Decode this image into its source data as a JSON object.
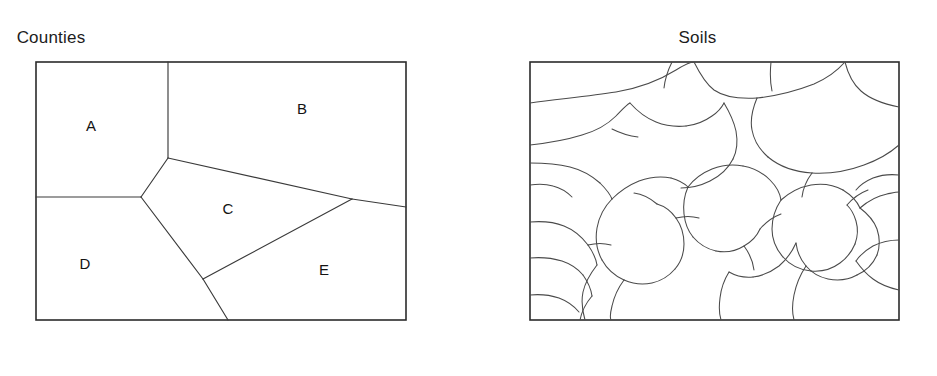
{
  "figure": {
    "background_color": "#ffffff",
    "line_color": "#3a3a3a",
    "frame_color": "#2b2b2b",
    "text_color": "#1c1c1c",
    "width": 937,
    "height": 376
  },
  "panels": [
    {
      "id": "counties",
      "title": "Counties",
      "frame": {
        "x": 36,
        "y": 62,
        "width": 370,
        "height": 258
      },
      "regions": [
        {
          "label": "A",
          "label_x": 91,
          "label_y": 127
        },
        {
          "label": "B",
          "label_x": 302,
          "label_y": 110
        },
        {
          "label": "C",
          "label_x": 228,
          "label_y": 210
        },
        {
          "label": "D",
          "label_x": 85,
          "label_y": 265
        },
        {
          "label": "E",
          "label_x": 324,
          "label_y": 271
        }
      ],
      "boundaries": [
        "M168,62 L168,158",
        "M36,197 L141,197",
        "M141,197 L168,158",
        "M168,158 L352,199",
        "M352,199 L406,207",
        "M352,199 L203,279",
        "M141,197 L203,279",
        "M203,279 L228,320"
      ]
    },
    {
      "id": "soils",
      "title": "Soils",
      "frame": {
        "x": 530,
        "y": 62,
        "width": 369,
        "height": 258
      },
      "polygon_count": 38,
      "polylines": [
        "M530,103 C560,99 590,96 616,92 C640,88 660,80 676,70 C684,65 690,62 694,62",
        "M694,62 C700,74 706,84 714,90 C724,97 740,99 757,98",
        "M757,98 C776,96 796,91 814,84 C828,78 838,70 845,62",
        "M845,62 C848,74 853,84 861,91 C870,99 884,104 899,107",
        "M757,98 C752,110 750,120 752,130 C754,141 760,150 768,157",
        "M768,157 C780,167 796,172 812,173",
        "M812,173 C830,174 848,171 864,165 C878,160 890,153 899,145",
        "M530,145 C548,143 566,140 582,135 C596,131 608,124 616,116 C622,110 626,105 630,103",
        "M630,103 C638,112 646,118 656,122 C666,126 676,127 686,126",
        "M686,126 C696,125 705,121 712,116 C718,112 722,107 724,103",
        "M724,103 C730,113 734,122 736,131 C738,142 737,151 733,159",
        "M733,159 C728,169 720,176 710,181 C700,186 690,188 681,188",
        "M530,163 C544,163 558,164 570,167 C582,170 592,176 600,183",
        "M600,183 C606,189 610,194 612,199",
        "M612,199 C620,191 629,185 639,181 C650,177 661,176 671,178",
        "M671,178 C678,180 684,183 688,187",
        "M688,187 C694,179 702,173 712,169 C722,165 733,164 743,166",
        "M743,166 C754,168 763,173 770,180 C776,186 780,193 781,200",
        "M781,200 C790,192 800,187 811,185 C823,183 834,185 843,190",
        "M843,190 C851,195 857,201 860,208",
        "M860,208 C868,201 877,196 887,194 C892,193 896,192 899,192",
        "M781,200 C775,209 772,219 772,229 C772,240 776,249 783,257",
        "M783,257 C790,265 800,270 811,271",
        "M811,271 C822,272 832,269 840,263 C847,258 852,251 855,244",
        "M855,244 C858,236 858,228 856,221 C854,214 851,209 847,205",
        "M612,199 C604,207 599,217 597,228 C595,240 597,251 602,260",
        "M602,260 C607,269 615,276 624,280",
        "M624,280 C633,284 643,285 652,283 C661,281 669,276 675,269",
        "M675,269 C681,262 684,253 684,244 C684,234 681,225 676,218",
        "M676,218 C671,211 664,206 657,204",
        "M688,187 C684,196 683,205 684,214 C685,223 688,231 693,237",
        "M693,237 C699,244 707,249 716,251",
        "M716,251 C726,253 736,251 744,246 C751,242 757,236 760,229",
        "M530,222 C542,221 554,222 564,226 C574,230 582,237 588,245",
        "M588,245 C593,252 596,259 597,265",
        "M597,265 C590,274 585,283 583,292 C581,302 582,310 585,320",
        "M530,258 C541,257 552,258 562,261 C571,264 578,269 583,275",
        "M583,275 C588,282 591,289 592,296",
        "M592,296 C586,303 582,310 580,320",
        "M860,208 C868,214 874,221 877,229 C880,238 880,247 877,255",
        "M877,255 C873,264 866,271 857,275",
        "M857,275 C848,280 838,281 828,279 C819,277 811,272 806,266",
        "M806,266 C800,259 797,251 796,243",
        "M796,243 C792,252 786,260 779,266 C771,272 762,276 753,277",
        "M753,277 C744,278 736,276 729,272",
        "M729,272 C724,280 721,289 720,298 C719,306 719,314 721,320",
        "M899,240 C890,240 881,242 873,246 C866,250 860,255 856,261",
        "M856,261 C861,268 866,274 873,279 C881,285 890,288 899,290",
        "M806,266 C800,275 796,285 794,295 C792,305 792,313 794,320",
        "M676,218 C684,216 692,216 699,218",
        "M657,204 C650,198 642,194 634,193",
        "M760,229 C766,222 773,217 781,214",
        "M530,295 C540,294 550,295 559,298 C567,301 574,306 579,312",
        "M744,246 C750,254 753,262 754,270",
        "M588,245 C596,243 604,243 611,245",
        "M847,205 C853,198 860,193 868,190",
        "M624,280 C618,288 614,297 612,306 C610,314 610,318 611,320",
        "M672,62 C668,70 665,79 664,88",
        "M771,62 C770,72 770,82 772,91",
        "M899,175 C890,174 881,175 873,178 C866,181 860,185 856,190",
        "M530,185 C538,184 546,184 553,186 C561,188 567,192 572,197",
        "M612,129 C620,133 629,136 638,137",
        "M812,173 C806,181 803,189 802,197"
      ]
    }
  ]
}
